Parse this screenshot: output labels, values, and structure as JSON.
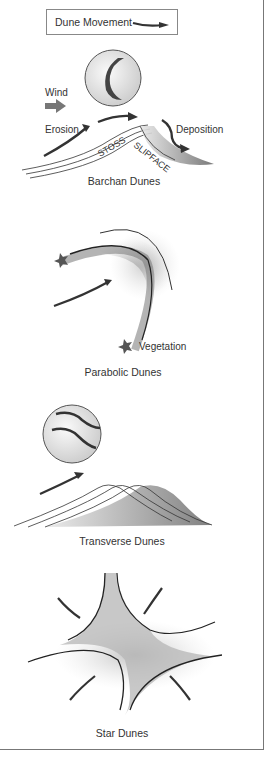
{
  "legend": {
    "label": "Dune Movement",
    "arrow_icon": "dune-movement-arrow-icon"
  },
  "barchan": {
    "caption": "Barchan Dunes",
    "labels": {
      "wind": "Wind",
      "erosion": "Erosion",
      "deposition": "Deposition",
      "stoss": "STOSS",
      "slipface": "SLIPFACE"
    }
  },
  "parabolic": {
    "caption": "Parabolic Dunes",
    "labels": {
      "vegetation": "Vegetation"
    }
  },
  "transverse": {
    "caption": "Transverse Dunes"
  },
  "star": {
    "caption": "Star Dunes"
  },
  "colors": {
    "ink": "#333333",
    "sand_shade": "#9a9a9a",
    "border": "#777777"
  }
}
